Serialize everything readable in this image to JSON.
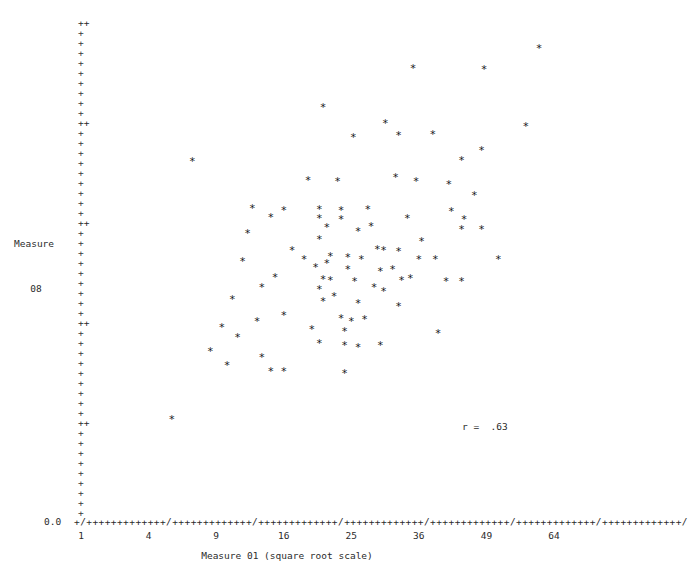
{
  "figure": {
    "marker_glyph": "*",
    "tick_glyph": "+",
    "major_tick_glyph": "++",
    "axis_break_glyph": "/",
    "marker_color": "#1a1a1a",
    "axis_color": "#2b2b2b",
    "background_color": "#ffffff"
  },
  "yaxis": {
    "title_line1": "Measure",
    "title_line2": "08",
    "labels": [
      "5.0",
      "4.0",
      "3.0",
      "2.0",
      "1.0",
      "0.0"
    ],
    "label_values": [
      5.0,
      4.0,
      3.0,
      2.0,
      1.0,
      0.0
    ],
    "minor_step": 0.1,
    "range": [
      0.0,
      5.0
    ]
  },
  "xaxis": {
    "title": "Measure 01 (square root scale)",
    "labels": [
      "1",
      "4",
      "9",
      "16",
      "25",
      "36",
      "49",
      "64"
    ],
    "label_values": [
      1,
      4,
      9,
      16,
      25,
      36,
      49,
      64
    ],
    "scale": "square root",
    "range": [
      1,
      64
    ],
    "axis_string": "+/+++++++++++++/+++++++++++++/+++++++++++++/+++++++++++++/+++++++++++++/+++++++++++++/+++++++++++++/"
  },
  "annotation": {
    "r_text": "r =  .63",
    "r_value": 0.63
  },
  "chart_data": {
    "type": "scatter",
    "title": "",
    "subtitle": "",
    "xlabel": "Measure 01 (square root scale)",
    "ylabel": "Measure 08",
    "xlim": [
      1,
      64
    ],
    "ylim": [
      0.0,
      5.0
    ],
    "xscale": "sqrt",
    "xticks": [
      1,
      4,
      9,
      16,
      25,
      36,
      49,
      64
    ],
    "yticks": [
      0.0,
      1.0,
      2.0,
      3.0,
      4.0,
      5.0
    ],
    "grid": false,
    "legend": "none",
    "marker": "*",
    "annotations": [
      "r =  .63"
    ],
    "n_points": 92,
    "correlation": 0.63,
    "points": [
      [
        60.5,
        4.73
      ],
      [
        35.0,
        4.53
      ],
      [
        48.5,
        4.52
      ],
      [
        21.0,
        4.14
      ],
      [
        30.3,
        3.98
      ],
      [
        57.5,
        3.95
      ],
      [
        32.5,
        3.86
      ],
      [
        38.5,
        3.87
      ],
      [
        25.3,
        3.84
      ],
      [
        48.0,
        3.71
      ],
      [
        7.0,
        3.6
      ],
      [
        44.0,
        3.61
      ],
      [
        32.0,
        3.44
      ],
      [
        41.5,
        3.37
      ],
      [
        46.5,
        3.26
      ],
      [
        12.5,
        3.13
      ],
      [
        16.0,
        3.11
      ],
      [
        20.5,
        3.12
      ],
      [
        23.5,
        3.11
      ],
      [
        27.5,
        3.12
      ],
      [
        14.5,
        3.04
      ],
      [
        20.5,
        3.03
      ],
      [
        23.5,
        3.02
      ],
      [
        34.0,
        3.03
      ],
      [
        44.5,
        3.02
      ],
      [
        21.5,
        2.94
      ],
      [
        44.0,
        2.92
      ],
      [
        48.0,
        2.92
      ],
      [
        12.0,
        2.88
      ],
      [
        20.5,
        2.82
      ],
      [
        36.5,
        2.8
      ],
      [
        17.0,
        2.71
      ],
      [
        29.0,
        2.72
      ],
      [
        30.0,
        2.71
      ],
      [
        32.5,
        2.7
      ],
      [
        22.0,
        2.65
      ],
      [
        24.5,
        2.64
      ],
      [
        26.5,
        2.62
      ],
      [
        39.0,
        2.62
      ],
      [
        51.5,
        2.62
      ],
      [
        20.0,
        2.54
      ],
      [
        24.5,
        2.52
      ],
      [
        29.5,
        2.5
      ],
      [
        15.0,
        2.44
      ],
      [
        21.0,
        2.42
      ],
      [
        22.0,
        2.41
      ],
      [
        25.5,
        2.4
      ],
      [
        33.0,
        2.41
      ],
      [
        41.0,
        2.4
      ],
      [
        44.0,
        2.4
      ],
      [
        13.5,
        2.34
      ],
      [
        20.5,
        2.32
      ],
      [
        30.0,
        2.3
      ],
      [
        10.5,
        2.22
      ],
      [
        21.0,
        2.2
      ],
      [
        26.0,
        2.18
      ],
      [
        32.5,
        2.15
      ],
      [
        16.0,
        2.06
      ],
      [
        23.5,
        2.03
      ],
      [
        25.0,
        2.0
      ],
      [
        9.5,
        1.94
      ],
      [
        19.5,
        1.92
      ],
      [
        24.0,
        1.9
      ],
      [
        39.5,
        1.88
      ],
      [
        11.0,
        1.84
      ],
      [
        20.5,
        1.78
      ],
      [
        24.0,
        1.76
      ],
      [
        29.5,
        1.76
      ],
      [
        8.5,
        1.7
      ],
      [
        13.5,
        1.64
      ],
      [
        10.0,
        1.56
      ],
      [
        14.5,
        1.5
      ],
      [
        16.0,
        1.5
      ],
      [
        5.5,
        1.02
      ],
      [
        26.0,
        2.9
      ],
      [
        21.5,
        2.58
      ],
      [
        35.5,
        3.4
      ],
      [
        23.0,
        3.4
      ],
      [
        28.5,
        2.34
      ],
      [
        18.5,
        2.62
      ],
      [
        27.0,
        2.02
      ],
      [
        36.0,
        2.62
      ],
      [
        42.0,
        3.1
      ],
      [
        19.0,
        3.41
      ],
      [
        31.5,
        2.52
      ],
      [
        24.0,
        1.48
      ],
      [
        26.0,
        1.74
      ],
      [
        13.0,
        2.0
      ],
      [
        22.5,
        2.25
      ],
      [
        28.0,
        2.95
      ],
      [
        34.5,
        2.43
      ],
      [
        11.5,
        2.6
      ]
    ]
  }
}
